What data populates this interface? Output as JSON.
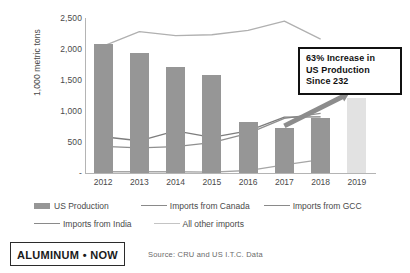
{
  "chart_data": {
    "type": "bar",
    "title": "",
    "xlabel": "",
    "ylabel": "1,000 metric tons",
    "categories": [
      "2012",
      "2013",
      "2014",
      "2015",
      "2016",
      "2017",
      "2018",
      "2019"
    ],
    "ylim": [
      0,
      2500
    ],
    "yticks": [
      "-",
      "500",
      "1,000",
      "1,500",
      "2,000",
      "2,500"
    ],
    "ytick_values": [
      0,
      500,
      1000,
      1500,
      2000,
      2500
    ],
    "grid": false,
    "legend_position": "bottom",
    "series": [
      {
        "name": "US Production",
        "type": "bar",
        "color": "#969696",
        "forecast_color": "#e2e2e2",
        "values": [
          2075,
          1940,
          1715,
          1580,
          830,
          730,
          880,
          1205
        ],
        "forecast_index": 7
      },
      {
        "name": "Imports from Canada",
        "type": "line",
        "color": "#8f8f8f",
        "values": [
          430,
          405,
          425,
          490,
          640,
          880,
          960,
          null
        ]
      },
      {
        "name": "Imports from GCC",
        "type": "line",
        "color": "#7d7d7d",
        "values": [
          585,
          520,
          680,
          575,
          680,
          900,
          905,
          null
        ]
      },
      {
        "name": "Imports from India",
        "type": "line",
        "color": "#a6a6a6",
        "values": [
          20,
          20,
          20,
          15,
          40,
          130,
          215,
          null
        ]
      },
      {
        "name": "All other imports",
        "type": "line",
        "color": "#b0b0b0",
        "values": [
          2045,
          2280,
          2215,
          2230,
          2300,
          2450,
          2160,
          null
        ]
      }
    ],
    "annotations": [
      {
        "name": "callout",
        "lines": [
          "63% Increase in",
          "US Production",
          "Since 232"
        ]
      },
      {
        "name": "growth-arrow",
        "description": "dark gray arrow pointing up-right from 2017 to 2019",
        "color": "#8c8c8c"
      }
    ]
  },
  "footer": {
    "logo_text": "ALUMINUM • NOW",
    "logo_sub": "",
    "source": "Source: CRU and US I.T.C. Data"
  }
}
